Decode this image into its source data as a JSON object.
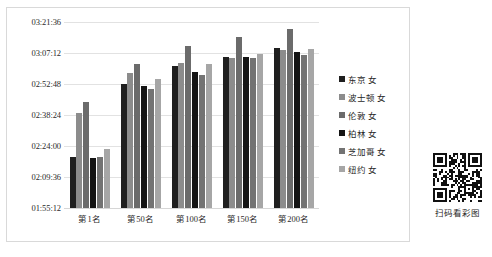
{
  "chart_data": {
    "type": "bar",
    "title": "",
    "xlabel": "",
    "ylabel": "",
    "grid": true,
    "legend_position": "right",
    "categories": [
      "第1名",
      "第50名",
      "第100名",
      "第150名",
      "第200名"
    ],
    "ytick_labels": [
      "03:21:36",
      "03:07:12",
      "02:52:48",
      "02:38:24",
      "02:24:00",
      "02:09:36",
      "01:55:12"
    ],
    "ytick_seconds": [
      12096,
      11232,
      10368,
      9504,
      8640,
      7776,
      6912
    ],
    "ylim_seconds": [
      6912,
      12096
    ],
    "series": [
      {
        "name": "东京 女",
        "color": "#1f1f1f",
        "values": [
          "02:18:59",
          "02:52:56",
          "03:01:24",
          "03:05:33",
          "03:09:43"
        ],
        "values_seconds": [
          8339,
          10376,
          10884,
          11133,
          11383
        ]
      },
      {
        "name": "波士顿 女",
        "color": "#8c8c8c",
        "values": [
          "02:39:22",
          "02:57:50",
          "03:02:31",
          "03:04:52",
          "03:08:38"
        ],
        "values_seconds": [
          9562,
          10670,
          10951,
          11092,
          11318
        ]
      },
      {
        "name": "伦敦 女",
        "color": "#6b6b6b",
        "values": [
          "02:44:19",
          "03:02:19",
          "03:10:41",
          "03:14:27",
          "03:18:10"
        ],
        "values_seconds": [
          9859,
          10939,
          11441,
          11667,
          11890
        ]
      },
      {
        "name": "柏林 女",
        "color": "#141414",
        "values": [
          "02:18:20",
          "02:52:02",
          "02:58:16",
          "03:05:09",
          "03:07:37"
        ],
        "values_seconds": [
          8300,
          10322,
          10696,
          11109,
          11257
        ]
      },
      {
        "name": "芝加哥 女",
        "color": "#737373",
        "values": [
          "02:18:54",
          "02:50:40",
          "02:56:48",
          "03:04:43",
          "03:06:27"
        ],
        "values_seconds": [
          8334,
          10240,
          10608,
          11083,
          11187
        ]
      },
      {
        "name": "纽约 女",
        "color": "#a6a6a6",
        "values": [
          "02:22:26",
          "02:55:02",
          "03:01:54",
          "03:06:35",
          "03:09:00"
        ],
        "values_seconds": [
          8546,
          10502,
          10914,
          11195,
          11340
        ]
      }
    ]
  },
  "legend": {
    "items": [
      {
        "label": "东京 女",
        "color": "#1f1f1f"
      },
      {
        "label": "波士顿 女",
        "color": "#8c8c8c"
      },
      {
        "label": "伦敦 女",
        "color": "#6b6b6b"
      },
      {
        "label": "柏林 女",
        "color": "#141414"
      },
      {
        "label": "芝加哥 女",
        "color": "#737373"
      },
      {
        "label": "纽约 女",
        "color": "#a6a6a6"
      }
    ]
  },
  "qr": {
    "caption": "扫码看彩图"
  }
}
